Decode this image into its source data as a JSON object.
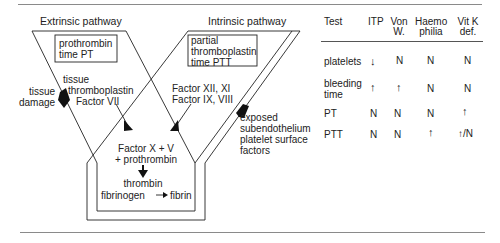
{
  "diagram": {
    "extrinsic_title": "Extrinsic pathway",
    "intrinsic_title": "Intrinsic pathway",
    "pt_box": [
      "prothrombin",
      "time PT"
    ],
    "ptt_box": [
      "partial",
      "thromboplastin",
      "time PTT"
    ],
    "tissue_damage": [
      "tissue",
      "damage"
    ],
    "tissue_thromboplastin": [
      "tissue",
      "thromboplastin",
      "Factor VII"
    ],
    "intrinsic_factors": [
      "Factor XII, XI",
      "Factor IX, VIII"
    ],
    "exposed": [
      "exposed",
      "subendothelium",
      "platelet surface",
      "factors"
    ],
    "common": [
      "Factor X + V",
      "+ prothrombin"
    ],
    "thrombin": "thrombin",
    "fibrinogen": "fibrinogen",
    "fibrin": "fibrin",
    "fibrin_arrow": "—▸"
  },
  "table": {
    "headers": [
      {
        "line1": "Test",
        "line2": ""
      },
      {
        "line1": "ITP",
        "line2": ""
      },
      {
        "line1": "Von",
        "line2": "W."
      },
      {
        "line1": "Haemo",
        "line2": "philia"
      },
      {
        "line1": "Vit K",
        "line2": "def."
      }
    ],
    "rows": [
      {
        "test": [
          "platelets"
        ],
        "itp": "↓",
        "von": "N",
        "haemo": "N",
        "vitk": "N"
      },
      {
        "test": [
          "bleeding",
          "time"
        ],
        "itp": "↑",
        "von": "↑",
        "haemo": "N",
        "vitk": "N"
      },
      {
        "test": [
          "PT"
        ],
        "itp": "N",
        "von": "N",
        "haemo": "N",
        "vitk": "↑"
      },
      {
        "test": [
          "PTT"
        ],
        "itp": "N",
        "von": "N",
        "haemo": "↑",
        "vitk": "↑/N"
      }
    ]
  }
}
